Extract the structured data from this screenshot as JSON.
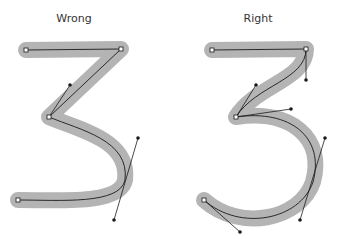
{
  "panels": [
    {
      "id": "wrong",
      "title": "Wrong"
    },
    {
      "id": "right",
      "title": "Right"
    }
  ],
  "colors": {
    "stroke_band": "#b4b4b4",
    "path": "#1a1a1a",
    "handle": "#1a1a1a",
    "anchor_fill": "#ffffff"
  }
}
